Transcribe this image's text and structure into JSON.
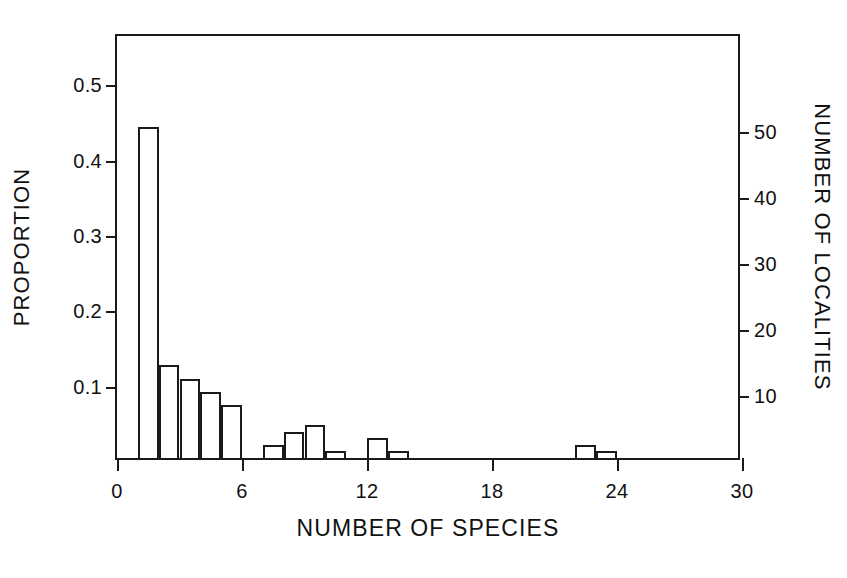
{
  "chart_data": {
    "type": "bar",
    "title": "",
    "subtitle": "",
    "xlabel": "NUMBER OF SPECIES",
    "ylabel": "PROPORTION",
    "ylabel_right": "NUMBER OF LOCALITIES",
    "grid": false,
    "legend": null,
    "xlim": [
      0,
      30
    ],
    "ylim": [
      0,
      0.5652
    ],
    "ylim_right": [
      0,
      64.5
    ],
    "bin_width": 1,
    "total_localities": 114,
    "xticks": [
      0,
      6,
      12,
      18,
      24,
      30
    ],
    "xticklabels": [
      "0",
      "6",
      "12",
      "18",
      "24",
      "30"
    ],
    "yticks": [
      0.1,
      0.2,
      0.3,
      0.4,
      0.5
    ],
    "yticklabels": [
      "0.1",
      "0.2",
      "0.3",
      "0.4",
      "0.5"
    ],
    "yticks_right": [
      10,
      20,
      30,
      40,
      50
    ],
    "yticklabels_right": [
      "10",
      "20",
      "30",
      "40",
      "50"
    ],
    "bins": [
      {
        "x0": 1,
        "x1": 2,
        "count": 50,
        "proportion": 0.4386
      },
      {
        "x0": 2,
        "x1": 3,
        "count": 14,
        "proportion": 0.1228
      },
      {
        "x0": 3,
        "x1": 4,
        "count": 12,
        "proportion": 0.1053
      },
      {
        "x0": 4,
        "x1": 5,
        "count": 10,
        "proportion": 0.0877
      },
      {
        "x0": 5,
        "x1": 6,
        "count": 8,
        "proportion": 0.0702
      },
      {
        "x0": 6,
        "x1": 7,
        "count": 0,
        "proportion": 0.0
      },
      {
        "x0": 7,
        "x1": 8,
        "count": 2,
        "proportion": 0.0175
      },
      {
        "x0": 8,
        "x1": 9,
        "count": 4,
        "proportion": 0.0351
      },
      {
        "x0": 9,
        "x1": 10,
        "count": 5,
        "proportion": 0.0439
      },
      {
        "x0": 10,
        "x1": 11,
        "count": 1,
        "proportion": 0.0088
      },
      {
        "x0": 11,
        "x1": 12,
        "count": 0,
        "proportion": 0.0
      },
      {
        "x0": 12,
        "x1": 13,
        "count": 3,
        "proportion": 0.0263
      },
      {
        "x0": 13,
        "x1": 14,
        "count": 1,
        "proportion": 0.0088
      },
      {
        "x0": 22,
        "x1": 23,
        "count": 2,
        "proportion": 0.0175
      },
      {
        "x0": 23,
        "x1": 24,
        "count": 1,
        "proportion": 0.0088
      }
    ]
  },
  "style": {
    "axis_color": "#1a1a1a",
    "bar_edge_color": "#1a1a1a",
    "bar_fill_color": "transparent",
    "background": "#ffffff"
  }
}
